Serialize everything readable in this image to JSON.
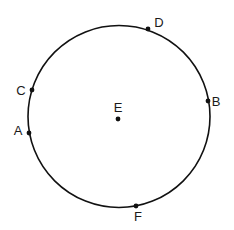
{
  "diagram": {
    "type": "circle-with-points",
    "circle": {
      "cx": 119,
      "cy": 116.5,
      "r": 91,
      "stroke": "#111111"
    },
    "points": [
      {
        "id": "D",
        "label": "D",
        "x": 148,
        "y": 29,
        "lx": 159,
        "ly": 27
      },
      {
        "id": "C",
        "label": "C",
        "x": 32,
        "y": 90,
        "lx": 21,
        "ly": 95
      },
      {
        "id": "B",
        "label": "B",
        "x": 208,
        "y": 101,
        "lx": 216,
        "ly": 106
      },
      {
        "id": "E",
        "label": "E",
        "x": 118,
        "y": 119,
        "lx": 118,
        "ly": 112
      },
      {
        "id": "A",
        "label": "A",
        "x": 29,
        "y": 133,
        "lx": 18,
        "ly": 135
      },
      {
        "id": "F",
        "label": "F",
        "x": 136,
        "y": 206,
        "lx": 138,
        "ly": 221
      }
    ]
  }
}
